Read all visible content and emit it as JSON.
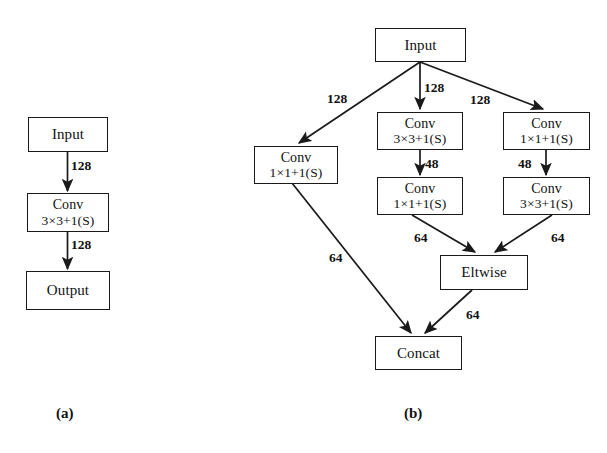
{
  "figure": {
    "background": "#ffffff",
    "ink": "#111111"
  },
  "subfigures": [
    {
      "caption": "(a)",
      "nodes": [
        {
          "id": "a-input",
          "label": "Input",
          "line1": "Input",
          "line2": ""
        },
        {
          "id": "a-conv",
          "label": "Conv 3×3+1(S)",
          "line1": "Conv",
          "line2": "3×3+1(S)"
        },
        {
          "id": "a-output",
          "label": "Output",
          "line1": "Output",
          "line2": ""
        }
      ],
      "edges": [
        {
          "from": "a-input",
          "to": "a-conv",
          "label": "128"
        },
        {
          "from": "a-conv",
          "to": "a-output",
          "label": "128"
        }
      ]
    },
    {
      "caption": "(b)",
      "nodes": [
        {
          "id": "b-input",
          "label": "Input",
          "line1": "Input",
          "line2": ""
        },
        {
          "id": "b-left-conv",
          "label": "Conv 1×1+1(S)",
          "line1": "Conv",
          "line2": "1×1+1(S)"
        },
        {
          "id": "b-mid-conv1",
          "label": "Conv 3×3+1(S)",
          "line1": "Conv",
          "line2": "3×3+1(S)"
        },
        {
          "id": "b-mid-conv2",
          "label": "Conv 1×1+1(S)",
          "line1": "Conv",
          "line2": "1×1+1(S)"
        },
        {
          "id": "b-right-conv1",
          "label": "Conv 1×1+1(S)",
          "line1": "Conv",
          "line2": "1×1+1(S)"
        },
        {
          "id": "b-right-conv2",
          "label": "Conv 3×3+1(S)",
          "line1": "Conv",
          "line2": "3×3+1(S)"
        },
        {
          "id": "b-eltwise",
          "label": "Eltwise",
          "line1": "Eltwise",
          "line2": ""
        },
        {
          "id": "b-concat",
          "label": "Concat",
          "line1": "Concat",
          "line2": ""
        }
      ],
      "edges": [
        {
          "from": "b-input",
          "to": "b-left-conv",
          "label": "128"
        },
        {
          "from": "b-input",
          "to": "b-mid-conv1",
          "label": "128"
        },
        {
          "from": "b-input",
          "to": "b-right-conv1",
          "label": "128"
        },
        {
          "from": "b-mid-conv1",
          "to": "b-mid-conv2",
          "label": "48"
        },
        {
          "from": "b-right-conv1",
          "to": "b-right-conv2",
          "label": "48"
        },
        {
          "from": "b-mid-conv2",
          "to": "b-eltwise",
          "label": "64"
        },
        {
          "from": "b-right-conv2",
          "to": "b-eltwise",
          "label": "64"
        },
        {
          "from": "b-left-conv",
          "to": "b-concat",
          "label": "64"
        },
        {
          "from": "b-eltwise",
          "to": "b-concat",
          "label": "64"
        }
      ]
    }
  ],
  "labels": {
    "caption_a": "(a)",
    "caption_b": "(b)",
    "a_edge_1": "128",
    "a_edge_2": "128",
    "b_in_left": "128",
    "b_in_mid": "128",
    "b_in_right": "128",
    "b_mid_48": "48",
    "b_right_48": "48",
    "b_mid_64": "64",
    "b_right_64": "64",
    "b_left_64": "64",
    "b_elt_64": "64"
  }
}
